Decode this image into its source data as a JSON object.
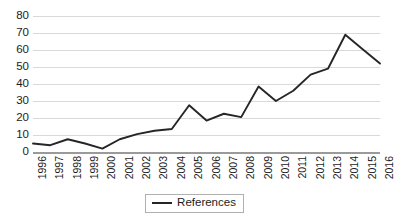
{
  "chart_data": {
    "type": "line",
    "title": "",
    "xlabel": "",
    "ylabel": "",
    "grid": true,
    "legend_position": "bottom",
    "ylim": [
      0,
      80
    ],
    "yticks": [
      0,
      10,
      20,
      30,
      40,
      50,
      60,
      70,
      80
    ],
    "categories": [
      "1996",
      "1997",
      "1998",
      "1999",
      "2000",
      "2001",
      "2002",
      "2003",
      "2004",
      "2005",
      "2006",
      "2007",
      "2008",
      "2009",
      "2010",
      "2011",
      "2012",
      "2013",
      "2014",
      "2015",
      "2016"
    ],
    "series": [
      {
        "name": "References",
        "color": "#262626",
        "values": [
          5,
          4,
          7.5,
          5,
          2,
          7.5,
          10.5,
          12.5,
          13.5,
          27.5,
          18.5,
          22.5,
          20.5,
          38.5,
          30,
          36,
          45.5,
          49,
          69,
          60.5,
          52
        ]
      }
    ]
  },
  "legend": {
    "entries": [
      {
        "label": "References",
        "marker": "line-swatch"
      }
    ]
  }
}
